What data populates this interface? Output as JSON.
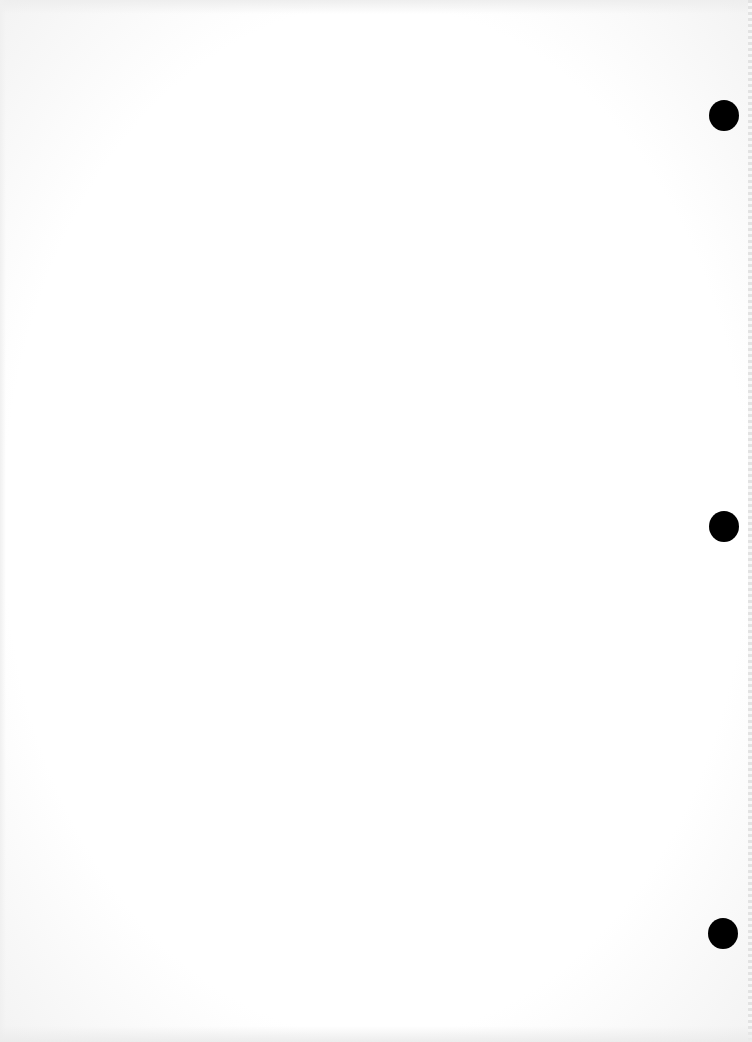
{
  "document": {
    "type": "blank scanned page",
    "text": "",
    "background_color": "#ffffff",
    "punch_holes": [
      {
        "name": "top",
        "x": 709,
        "y": 100
      },
      {
        "name": "middle",
        "x": 709,
        "y": 511
      },
      {
        "name": "bottom",
        "x": 708,
        "y": 918
      }
    ],
    "hole_color": "#000000"
  }
}
